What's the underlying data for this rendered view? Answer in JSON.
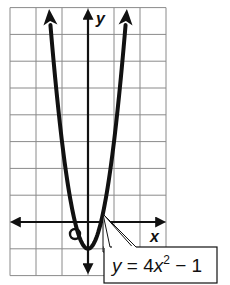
{
  "chart_data": {
    "type": "line",
    "title": "",
    "equation": "y = 4x^2 - 1",
    "xlabel": "x",
    "ylabel": "y",
    "xlim": [
      -3,
      3
    ],
    "ylim": [
      -2,
      8
    ],
    "grid": true,
    "grid_step": 1,
    "origin_label": "O",
    "series": [
      {
        "name": "y = 4x^2 - 1",
        "x": [
          -1.5,
          -1.25,
          -1,
          -0.75,
          -0.5,
          -0.25,
          0,
          0.25,
          0.5,
          0.75,
          1,
          1.25,
          1.5
        ],
        "y": [
          8,
          5.25,
          3,
          1.25,
          0,
          -0.75,
          -1,
          -0.75,
          0,
          1.25,
          3,
          5.25,
          8
        ]
      }
    ],
    "annotations": [
      {
        "type": "callout",
        "text_parts": [
          "y",
          " = 4",
          "x",
          "2",
          " − 1"
        ],
        "points_to": [
          0.5,
          0
        ]
      }
    ]
  },
  "labels": {
    "x_axis": "x",
    "y_axis": "y",
    "origin": "O",
    "eq_y": "y",
    "eq_mid": " = 4",
    "eq_x": "x",
    "eq_exp": "2",
    "eq_tail": " − 1"
  },
  "colors": {
    "grid": "#8a8a8a",
    "axis": "#111111",
    "curve": "#111111"
  }
}
